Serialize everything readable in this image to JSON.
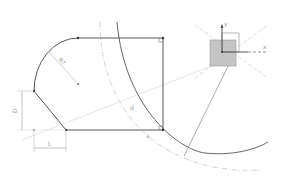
{
  "view": {
    "type": "cad-sketch",
    "background": "#ffffff"
  },
  "colors": {
    "geometry": "#555555",
    "construction": "#b8b8b8",
    "dimension": "#9a9a9a",
    "origin_fill": "#c4c4c4",
    "point": "#333333"
  },
  "dimensions": {
    "radius_label": "R?",
    "vertical_label": "D",
    "horizontal_label": "L",
    "tangent_label_1": "d",
    "tangent_label_2": "a"
  },
  "axes": {
    "x_label": "x",
    "y_label": "y",
    "z_label": "z"
  }
}
